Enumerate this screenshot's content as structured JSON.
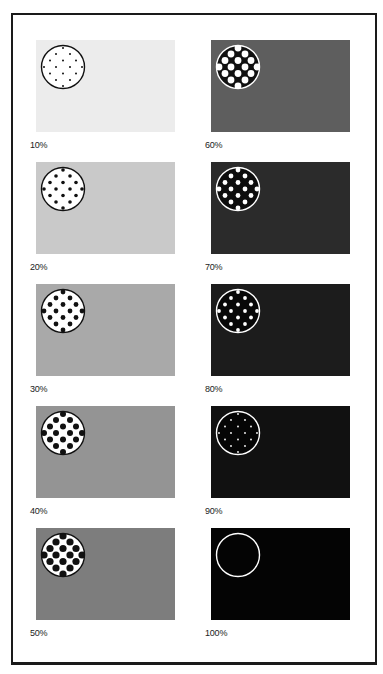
{
  "figure": {
    "title": "",
    "caption": ""
  },
  "panels": [
    {
      "label": "10%",
      "column": "left",
      "row": 0,
      "bg": "#ececec",
      "circle_fill": "#ffffff",
      "dot_color": "#111111",
      "ring_color": "#111111",
      "dot_radius": 1.0
    },
    {
      "label": "20%",
      "column": "left",
      "row": 1,
      "bg": "#c9c9c9",
      "circle_fill": "#ffffff",
      "dot_color": "#111111",
      "ring_color": "#111111",
      "dot_radius": 1.8
    },
    {
      "label": "30%",
      "column": "left",
      "row": 2,
      "bg": "#a9a9a9",
      "circle_fill": "#ffffff",
      "dot_color": "#111111",
      "ring_color": "#111111",
      "dot_radius": 2.4
    },
    {
      "label": "40%",
      "column": "left",
      "row": 3,
      "bg": "#949494",
      "circle_fill": "#ffffff",
      "dot_color": "#111111",
      "ring_color": "#111111",
      "dot_radius": 3.0
    },
    {
      "label": "50%",
      "column": "left",
      "row": 4,
      "bg": "#7d7d7d",
      "circle_fill": "#ffffff",
      "dot_color": "#111111",
      "ring_color": "#111111",
      "dot_radius": 3.6
    },
    {
      "label": "60%",
      "column": "right",
      "row": 0,
      "bg": "#5e5e5e",
      "circle_fill": "#111111",
      "dot_color": "#ffffff",
      "ring_color": "#ffffff",
      "dot_radius": 3.4
    },
    {
      "label": "70%",
      "column": "right",
      "row": 1,
      "bg": "#2b2b2b",
      "circle_fill": "#0d0d0d",
      "dot_color": "#ffffff",
      "ring_color": "#ffffff",
      "dot_radius": 2.4
    },
    {
      "label": "80%",
      "column": "right",
      "row": 2,
      "bg": "#1c1c1c",
      "circle_fill": "#080808",
      "dot_color": "#ffffff",
      "ring_color": "#ffffff",
      "dot_radius": 1.9
    },
    {
      "label": "90%",
      "column": "right",
      "row": 3,
      "bg": "#111111",
      "circle_fill": "#050505",
      "dot_color": "#ffffff",
      "ring_color": "#ffffff",
      "dot_radius": 0.9
    },
    {
      "label": "100%",
      "column": "right",
      "row": 4,
      "bg": "#040404",
      "circle_fill": "#040404",
      "dot_color": "#040404",
      "ring_color": "#ffffff",
      "dot_radius": 0
    }
  ]
}
